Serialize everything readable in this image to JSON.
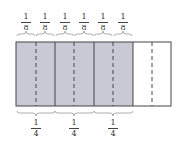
{
  "diagram": {
    "top_labels": [
      {
        "num": "1",
        "den": "8",
        "cx": 26
      },
      {
        "num": "1",
        "den": "8",
        "cx": 45
      },
      {
        "num": "1",
        "den": "8",
        "cx": 65
      },
      {
        "num": "1",
        "den": "8",
        "cx": 84
      },
      {
        "num": "1",
        "den": "8",
        "cx": 103
      },
      {
        "num": "1",
        "den": "8",
        "cx": 123
      }
    ],
    "bottom_labels": [
      {
        "num": "1",
        "den": "4",
        "cx": 36
      },
      {
        "num": "1",
        "den": "4",
        "cx": 74
      },
      {
        "num": "1",
        "den": "4",
        "cx": 113
      }
    ],
    "rectangle": {
      "total_parts": 8,
      "shaded_parts": 6
    },
    "colors": {
      "shade": "#c9c9d6",
      "line": "#444444",
      "brace": "#888888"
    }
  }
}
